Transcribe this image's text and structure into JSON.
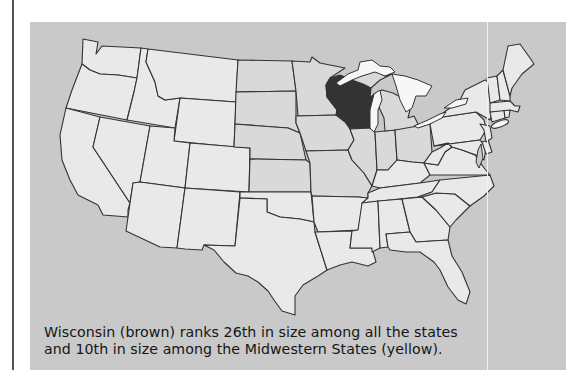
{
  "figure": {
    "type": "map",
    "region": "United States (contiguous)",
    "highlighted_state": {
      "name": "Wisconsin",
      "color_label": "brown",
      "render_color": "#333333"
    },
    "group": {
      "name": "Midwestern States",
      "color_label": "yellow",
      "render_color": "#d9d9d9"
    },
    "other_states_color": "#e9e9e9",
    "water_color": "#c9c9c9",
    "lakes_color": "#f7f7f7",
    "caption": {
      "line1": "Wisconsin (brown) ranks 26th in size among all the states",
      "line2": "and 10th in size among the Midwestern States (yellow)."
    },
    "facts": {
      "rank_among_all_states": 26,
      "rank_among_midwestern_states": 10
    }
  }
}
